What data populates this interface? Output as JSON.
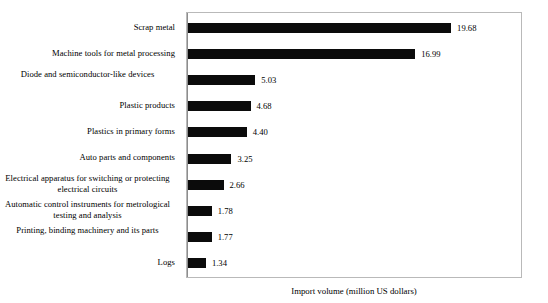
{
  "chart_data": {
    "type": "bar",
    "orientation": "horizontal",
    "title": "",
    "subtitle": "",
    "xlabel": "Import volume (million US dollars)",
    "ylabel": "",
    "grid": false,
    "legend": null,
    "xlim": [
      0,
      24.8
    ],
    "categories": [
      "Scrap metal",
      "Machine tools for metal processing",
      "Diode and semiconductor-like devices",
      "Plastic products",
      "Plastics in primary forms",
      "Auto parts and components",
      "Electrical apparatus for switching or protecting electrical circuits",
      "Automatic control instruments for metrological testing and analysis",
      "Printing, binding machinery and its parts",
      "Logs"
    ],
    "values": [
      19.68,
      16.99,
      5.03,
      4.68,
      4.4,
      3.25,
      2.66,
      1.78,
      1.77,
      1.34
    ],
    "value_labels": [
      "19.68",
      "16.99",
      "5.03",
      "4.68",
      "4.40",
      "3.25",
      "2.66",
      "1.78",
      "1.77",
      "1.34"
    ],
    "bar_color": "#0b0b0b",
    "plot_background": "#ffffff",
    "frame_color": "#b9b9b9"
  },
  "axis": {
    "xtitle": "Import volume (million US dollars)"
  },
  "rows": [
    {
      "label": "Scrap metal",
      "value_label": "19.68",
      "wrapped": false
    },
    {
      "label": "Machine tools for metal processing",
      "value_label": "16.99",
      "wrapped": false
    },
    {
      "label": "Diode and semiconductor-like devices",
      "value_label": "5.03",
      "wrapped": true
    },
    {
      "label": "Plastic products",
      "value_label": "4.68",
      "wrapped": false
    },
    {
      "label": "Plastics in primary forms",
      "value_label": "4.40",
      "wrapped": false
    },
    {
      "label": "Auto parts and components",
      "value_label": "3.25",
      "wrapped": false
    },
    {
      "label": "Electrical apparatus for switching or protecting electrical circuits",
      "value_label": "2.66",
      "wrapped": true
    },
    {
      "label": "Automatic control instruments for metrological testing and analysis",
      "value_label": "1.78",
      "wrapped": true
    },
    {
      "label": "Printing, binding machinery and its parts",
      "value_label": "1.77",
      "wrapped": true
    },
    {
      "label": "Logs",
      "value_label": "1.34",
      "wrapped": false
    }
  ]
}
